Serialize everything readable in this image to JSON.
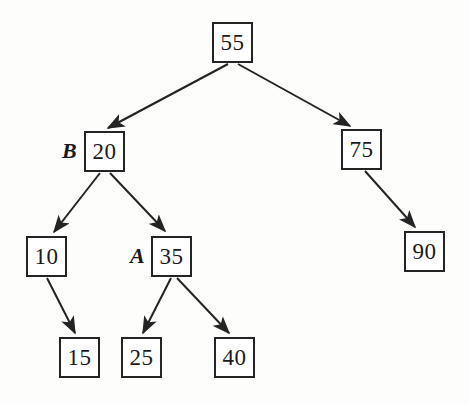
{
  "figure": {
    "kind": "binary-search-tree-diagram",
    "background_color": "#fdfdfc",
    "ink_color": "#242424",
    "width": 469,
    "height": 404
  },
  "nodes": [
    {
      "id": "n55",
      "value": "55",
      "x": 212,
      "y": 22,
      "w": 41,
      "h": 41
    },
    {
      "id": "n20",
      "value": "20",
      "x": 84,
      "y": 131,
      "w": 41,
      "h": 41,
      "side_label": "B",
      "label_x": 62,
      "label_y": 138
    },
    {
      "id": "n75",
      "value": "75",
      "x": 341,
      "y": 129,
      "w": 41,
      "h": 41
    },
    {
      "id": "n10",
      "value": "10",
      "x": 26,
      "y": 236,
      "w": 41,
      "h": 41
    },
    {
      "id": "n35",
      "value": "35",
      "x": 151,
      "y": 236,
      "w": 41,
      "h": 41,
      "side_label": "A",
      "label_x": 130,
      "label_y": 243
    },
    {
      "id": "n90",
      "value": "90",
      "x": 404,
      "y": 231,
      "w": 41,
      "h": 41
    },
    {
      "id": "n15",
      "value": "15",
      "x": 59,
      "y": 337,
      "w": 41,
      "h": 41
    },
    {
      "id": "n25",
      "value": "25",
      "x": 121,
      "y": 337,
      "w": 41,
      "h": 41
    },
    {
      "id": "n40",
      "value": "40",
      "x": 214,
      "y": 337,
      "w": 41,
      "h": 41
    }
  ],
  "edges": [
    {
      "id": "e-55-20",
      "from": "n55",
      "to": "n20",
      "x1": 228,
      "y1": 64,
      "x2": 108,
      "y2": 128,
      "arrow": true
    },
    {
      "id": "e-55-75",
      "from": "n55",
      "to": "n75",
      "x1": 238,
      "y1": 64,
      "x2": 350,
      "y2": 126,
      "arrow": true
    },
    {
      "id": "e-20-10",
      "from": "n20",
      "to": "n10",
      "x1": 100,
      "y1": 173,
      "x2": 54,
      "y2": 232,
      "arrow": true
    },
    {
      "id": "e-20-35",
      "from": "n20",
      "to": "n35",
      "x1": 110,
      "y1": 173,
      "x2": 165,
      "y2": 231,
      "arrow": true
    },
    {
      "id": "e-10-15",
      "from": "n10",
      "to": "n15",
      "x1": 47,
      "y1": 278,
      "x2": 75,
      "y2": 333,
      "arrow": true
    },
    {
      "id": "e-35-25",
      "from": "n35",
      "to": "n25",
      "x1": 171,
      "y1": 278,
      "x2": 143,
      "y2": 333,
      "arrow": true
    },
    {
      "id": "e-35-40",
      "from": "n35",
      "to": "n40",
      "x1": 177,
      "y1": 278,
      "x2": 229,
      "y2": 333,
      "arrow": true
    },
    {
      "id": "e-75-90",
      "from": "n75",
      "to": "n90",
      "x1": 365,
      "y1": 171,
      "x2": 415,
      "y2": 227,
      "arrow": true
    }
  ]
}
